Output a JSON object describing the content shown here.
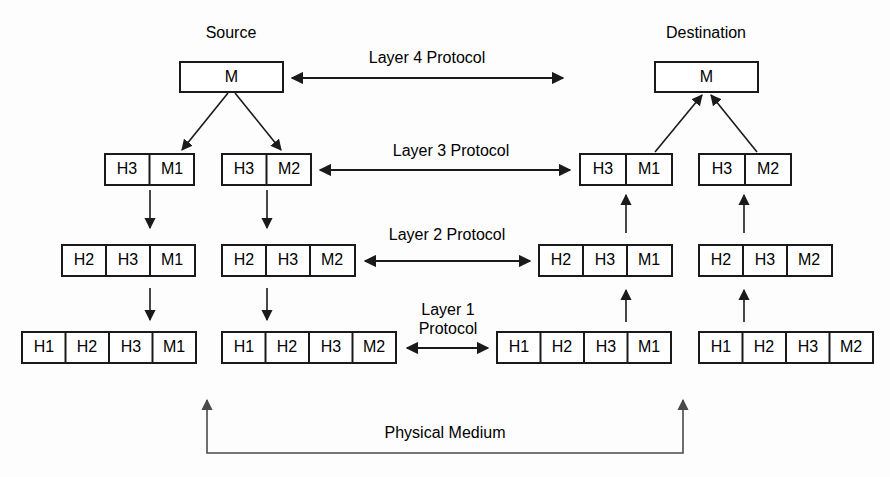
{
  "endpoints": {
    "source": "Source",
    "destination": "Destination"
  },
  "protocols": {
    "layer4": "Layer 4 Protocol",
    "layer3": "Layer 3 Protocol",
    "layer2": "Layer 2 Protocol",
    "layer1_line1": "Layer 1",
    "layer1_line2": "Protocol"
  },
  "medium": {
    "label": "Physical Medium"
  },
  "pdus": {
    "source_l4": [
      "M"
    ],
    "dest_l4": [
      "M"
    ],
    "source_l3_a": [
      "H3",
      "M1"
    ],
    "source_l3_b": [
      "H3",
      "M2"
    ],
    "dest_l3_a": [
      "H3",
      "M1"
    ],
    "dest_l3_b": [
      "H3",
      "M2"
    ],
    "source_l2_a": [
      "H2",
      "H3",
      "M1"
    ],
    "source_l2_b": [
      "H2",
      "H3",
      "M2"
    ],
    "dest_l2_a": [
      "H2",
      "H3",
      "M1"
    ],
    "dest_l2_b": [
      "H2",
      "H3",
      "M2"
    ],
    "source_l1_a": [
      "H1",
      "H2",
      "H3",
      "M1"
    ],
    "source_l1_b": [
      "H1",
      "H2",
      "H3",
      "M2"
    ],
    "dest_l1_a": [
      "H1",
      "H2",
      "H3",
      "M1"
    ],
    "dest_l1_b": [
      "H1",
      "H2",
      "H3",
      "M2"
    ]
  },
  "colors": {
    "stroke": "#1a1a1a",
    "fill": "#ffffff",
    "background": "#fdfdfd",
    "medium_stroke": "#4a4a4a"
  }
}
